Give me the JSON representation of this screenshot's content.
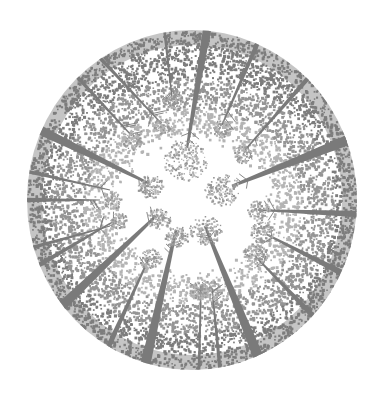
{
  "illustration": {
    "title": "Stippled fisheye view looking up through a forest canopy",
    "canvas": {
      "width": 385,
      "height": 405,
      "background": "#ffffff"
    },
    "circle": {
      "cx": 192,
      "cy": 200,
      "rx": 165,
      "ry": 170
    },
    "colors": {
      "trunk": "#7a7a7a",
      "stipple_dark": "#7d7d7d",
      "stipple_mid": "#959595",
      "stipple_light": "#b4b4b4",
      "sky": "#ffffff"
    },
    "sky_opening": {
      "cx": 192,
      "cy": 205,
      "rx": 95,
      "ry": 85
    },
    "trunks": [
      {
        "base": [
          207,
          30
        ],
        "tip": [
          187,
          148
        ],
        "width": 9
      },
      {
        "base": [
          165,
          35
        ],
        "tip": [
          172,
          98
        ],
        "width": 3
      },
      {
        "base": [
          258,
          42
        ],
        "tip": [
          222,
          125
        ],
        "width": 5
      },
      {
        "base": [
          310,
          76
        ],
        "tip": [
          245,
          150
        ],
        "width": 5
      },
      {
        "base": [
          348,
          140
        ],
        "tip": [
          232,
          186
        ],
        "width": 11
      },
      {
        "base": [
          356,
          214
        ],
        "tip": [
          258,
          210
        ],
        "width": 7
      },
      {
        "base": [
          340,
          272
        ],
        "tip": [
          266,
          234
        ],
        "width": 7
      },
      {
        "base": [
          315,
          318
        ],
        "tip": [
          255,
          256
        ],
        "width": 6
      },
      {
        "base": [
          258,
          356
        ],
        "tip": [
          205,
          226
        ],
        "width": 11
      },
      {
        "base": [
          220,
          370
        ],
        "tip": [
          212,
          288
        ],
        "width": 4
      },
      {
        "base": [
          199,
          370
        ],
        "tip": [
          201,
          286
        ],
        "width": 3
      },
      {
        "base": [
          145,
          366
        ],
        "tip": [
          176,
          230
        ],
        "width": 11
      },
      {
        "base": [
          106,
          352
        ],
        "tip": [
          150,
          256
        ],
        "width": 6
      },
      {
        "base": [
          66,
          302
        ],
        "tip": [
          156,
          216
        ],
        "width": 10
      },
      {
        "base": [
          44,
          262
        ],
        "tip": [
          116,
          220
        ],
        "width": 5
      },
      {
        "base": [
          38,
          246
        ],
        "tip": [
          110,
          226
        ],
        "width": 4
      },
      {
        "base": [
          28,
          200
        ],
        "tip": [
          100,
          200
        ],
        "width": 5
      },
      {
        "base": [
          30,
          172
        ],
        "tip": [
          110,
          190
        ],
        "width": 4
      },
      {
        "base": [
          40,
          130
        ],
        "tip": [
          150,
          184
        ],
        "width": 10
      },
      {
        "base": [
          80,
          80
        ],
        "tip": [
          132,
          136
        ],
        "width": 4
      },
      {
        "base": [
          102,
          60
        ],
        "tip": [
          160,
          122
        ],
        "width": 4
      }
    ],
    "crowns": [
      {
        "cx": 185,
        "cy": 160,
        "r": 22
      },
      {
        "cx": 172,
        "cy": 100,
        "r": 10
      },
      {
        "cx": 222,
        "cy": 128,
        "r": 10
      },
      {
        "cx": 243,
        "cy": 154,
        "r": 10
      },
      {
        "cx": 222,
        "cy": 190,
        "r": 18
      },
      {
        "cx": 258,
        "cy": 210,
        "r": 11
      },
      {
        "cx": 262,
        "cy": 232,
        "r": 12
      },
      {
        "cx": 255,
        "cy": 254,
        "r": 12
      },
      {
        "cx": 205,
        "cy": 230,
        "r": 16
      },
      {
        "cx": 210,
        "cy": 290,
        "r": 11
      },
      {
        "cx": 198,
        "cy": 290,
        "r": 10
      },
      {
        "cx": 176,
        "cy": 236,
        "r": 12
      },
      {
        "cx": 150,
        "cy": 258,
        "r": 11
      },
      {
        "cx": 158,
        "cy": 218,
        "r": 12
      },
      {
        "cx": 118,
        "cy": 220,
        "r": 9
      },
      {
        "cx": 112,
        "cy": 200,
        "r": 9
      },
      {
        "cx": 150,
        "cy": 186,
        "r": 13
      },
      {
        "cx": 132,
        "cy": 140,
        "r": 10
      },
      {
        "cx": 162,
        "cy": 126,
        "r": 9
      }
    ],
    "stipple": {
      "seed": 7,
      "rim_dots": 9000,
      "crown_dots_per_r": 9
    }
  }
}
